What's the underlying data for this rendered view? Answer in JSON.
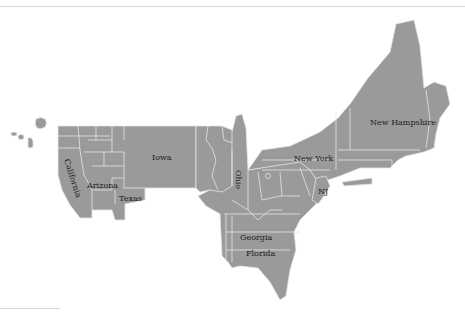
{
  "map": {
    "type": "cartogram",
    "subject": "United States (distorted state areas)",
    "fill_color": "#9a9a9a",
    "border_color": "#e4e4e4",
    "background": "#ffffff",
    "labels": {
      "california": "California",
      "arizona": "Arizona",
      "texas": "Texas",
      "iowa": "Iowa",
      "ohio": "Ohio",
      "new_york": "New York",
      "nj": "NJ",
      "new_hampshire": "New Hampshire",
      "georgia": "Georgia",
      "florida": "Florida"
    }
  }
}
